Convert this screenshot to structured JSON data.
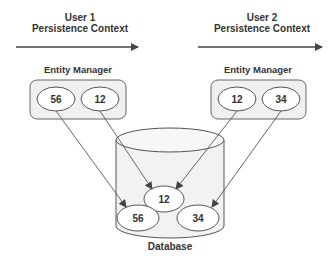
{
  "user1": {
    "title": "User 1",
    "subtitle": "Persistence Context"
  },
  "user2": {
    "title": "User 2",
    "subtitle": "Persistence Context"
  },
  "entity_manager_left": {
    "label": "Entity Manager",
    "entities": [
      "56",
      "12"
    ]
  },
  "entity_manager_right": {
    "label": "Entity Manager",
    "entities": [
      "12",
      "34"
    ]
  },
  "database": {
    "label": "Database",
    "entities": [
      "12",
      "56",
      "34"
    ]
  },
  "colors": {
    "stroke": "#555555",
    "box_fill": "#f0f0f0",
    "ellipse_fill": "#ffffff",
    "db_fill": "#f2f2f2",
    "text": "#333333"
  }
}
